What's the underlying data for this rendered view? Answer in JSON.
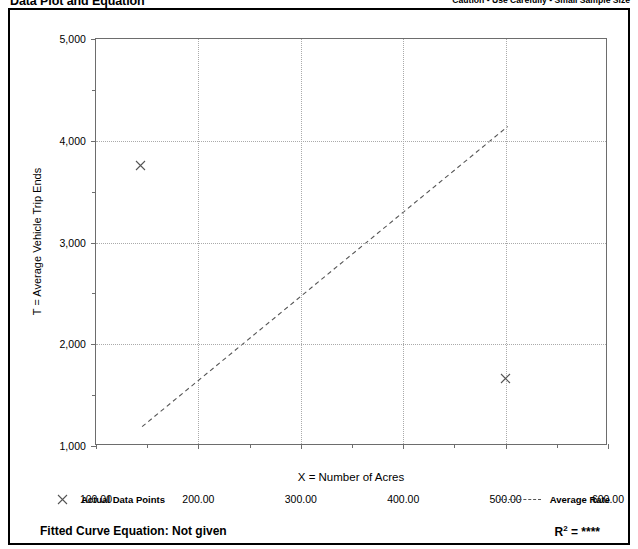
{
  "header": {
    "title": "Data Plot and Equation",
    "caution": "Caution - Use Carefully - Small Sample Size"
  },
  "legend": {
    "points_label": "Actual Data Points",
    "points_marker": "x-marker-icon",
    "rate_label": "Average Rate",
    "rate_marker": "dashed-line-icon"
  },
  "footer": {
    "fitted_curve_label": "Fitted Curve Equation:  Not given",
    "r_squared_prefix": "R",
    "r_squared_exp": "2",
    "r_squared_value": "= ****"
  },
  "colors": {
    "axis": "#6d6d6d",
    "grid": "#aaaaaa",
    "marker": "#555555",
    "trend": "#555555",
    "frame": "#000000"
  },
  "chart_data": {
    "type": "scatter",
    "title": "Data Plot and Equation",
    "xlabel": "X = Number of Acres",
    "ylabel": "T = Average Vehicle Trip Ends",
    "xlim": [
      100,
      600
    ],
    "ylim": [
      1000,
      5000
    ],
    "x_ticks": [
      100,
      200,
      300,
      400,
      500,
      600
    ],
    "x_tick_labels": [
      "100.00",
      "200.00",
      "300.00",
      "400.00",
      "500.00",
      "600.00"
    ],
    "x_minor_ticks": [
      150,
      250,
      350,
      450,
      550
    ],
    "y_ticks": [
      1000,
      2000,
      3000,
      4000,
      5000
    ],
    "y_tick_labels": [
      "1,000",
      "2,000",
      "3,000",
      "4,000",
      "5,000"
    ],
    "y_minor_ticks": [
      1500,
      2500,
      3500,
      4500
    ],
    "grid": true,
    "grid_x": [
      200,
      300,
      400,
      500
    ],
    "grid_y": [
      2000,
      3000,
      4000
    ],
    "legend_position": "below-plot",
    "series": [
      {
        "name": "Actual Data Points",
        "type": "scatter",
        "marker": "x",
        "points": [
          {
            "x": 143,
            "y": 3760
          },
          {
            "x": 500,
            "y": 1665
          }
        ]
      },
      {
        "name": "Average Rate",
        "type": "line",
        "style": "dashed",
        "points": [
          {
            "x": 145,
            "y": 1190
          },
          {
            "x": 502,
            "y": 4140
          }
        ]
      }
    ],
    "annotations": {
      "fitted_curve_equation": "Not given",
      "r_squared": "****",
      "caution": "Caution - Use Carefully - Small Sample Size"
    }
  }
}
